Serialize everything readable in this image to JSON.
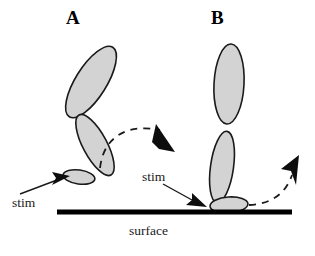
{
  "figure": {
    "type": "schematic-diagram",
    "background_color": "#ffffff",
    "outline_color": "#1a1a1a",
    "fill_color": "#d3d3d3",
    "surface_color": "#000000",
    "panels": [
      {
        "id": "A",
        "label": "A",
        "description": "two-segment structure with foot lifted off the surface, bent at joint",
        "stim_label": "stim",
        "stim_direction": "up-right",
        "motion_arc": "clockwise arc over to the right, arrowhead pointing down-right"
      },
      {
        "id": "B",
        "label": "B",
        "description": "two-segment structure standing nearly upright with foot contacting the surface",
        "stim_label": "stim",
        "stim_direction": "down-right",
        "motion_arc": "arc rising to the right, arrowhead pointing up-right"
      }
    ],
    "surface_label": "surface",
    "stim_label": "stim"
  },
  "geometry": {
    "surface_line": {
      "x1": 57,
      "y1": 212,
      "x2": 292,
      "y2": 212,
      "thickness": 5
    },
    "panel_a": {
      "upper_segment": {
        "cx": 91,
        "cy": 82,
        "rx": 15.5,
        "ry": 41,
        "rotation": 32
      },
      "lower_segment": {
        "cx": 95,
        "cy": 145,
        "rx": 12,
        "ry": 34,
        "rotation": -28
      },
      "foot": {
        "cx": 79,
        "cy": 177,
        "rx": 16,
        "ry": 7,
        "rotation": 8
      }
    },
    "panel_b": {
      "upper_segment": {
        "cx": 229,
        "cy": 84,
        "rx": 15,
        "ry": 40,
        "rotation": 3
      },
      "lower_segment": {
        "cx": 222,
        "cy": 167,
        "rx": 11.5,
        "ry": 36,
        "rotation": 8
      },
      "foot": {
        "cx": 229,
        "cy": 205,
        "rx": 19,
        "ry": 8,
        "rotation": -4
      }
    }
  }
}
